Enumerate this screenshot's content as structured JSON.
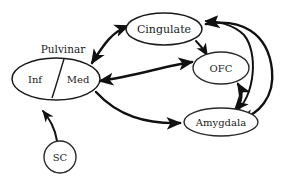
{
  "diagram": {
    "background_color": "#ffffff",
    "line_color": "#111111",
    "nodes": [
      {
        "id": "pulvinar_group",
        "label": "Pulvinar",
        "type": "group-label",
        "cx": 63,
        "cy": 50
      },
      {
        "id": "pulvinar_inf",
        "label": "Inf",
        "type": "ellipse-half",
        "cx": 38,
        "cy": 79
      },
      {
        "id": "pulvinar_med",
        "label": "Med",
        "type": "ellipse-half",
        "cx": 77,
        "cy": 79
      },
      {
        "id": "cingulate",
        "label": "Cingulate",
        "type": "ellipse",
        "cx": 164,
        "cy": 29,
        "rx": 38,
        "ry": 16
      },
      {
        "id": "ofc",
        "label": "OFC",
        "type": "ellipse",
        "cx": 221,
        "cy": 68,
        "rx": 28,
        "ry": 16
      },
      {
        "id": "amygdala",
        "label": "Amygdala",
        "type": "ellipse",
        "cx": 221,
        "cy": 122,
        "rx": 37,
        "ry": 14
      },
      {
        "id": "sc",
        "label": "SC",
        "type": "circle",
        "cx": 60,
        "cy": 157,
        "r": 16
      }
    ],
    "edges": [
      {
        "from": "pulvinar_med",
        "to": "cingulate",
        "direction": "bidirectional"
      },
      {
        "from": "pulvinar_med",
        "to": "ofc",
        "direction": "bidirectional"
      },
      {
        "from": "pulvinar_med",
        "to": "amygdala",
        "direction": "forward"
      },
      {
        "from": "cingulate",
        "to": "ofc",
        "direction": "forward"
      },
      {
        "from": "cingulate",
        "to": "amygdala",
        "direction": "bidirectional"
      },
      {
        "from": "ofc",
        "to": "amygdala",
        "direction": "bidirectional"
      },
      {
        "from": "amygdala",
        "to": "cingulate",
        "direction": "forward"
      },
      {
        "from": "sc",
        "to": "pulvinar_inf",
        "direction": "forward"
      }
    ]
  }
}
